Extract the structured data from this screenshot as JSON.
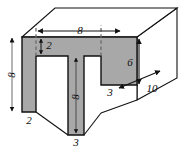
{
  "figure": {
    "name": "u-shaped-prism-diagram",
    "colors": {
      "face_fill": "#a8a8a8",
      "top_fill": "#ffffff",
      "side_fill": "#ffffff",
      "outline": "#111111",
      "hidden_line": "#6b6b6b",
      "background": "#ffffff",
      "text": "#0d0d0d"
    },
    "dimensions": [
      {
        "id": "top-width",
        "label": "8",
        "x": 80,
        "y": 32,
        "orientation": "horizontal",
        "describes": "width of the top of the U across the front face"
      },
      {
        "id": "flange-thickness",
        "label": "2",
        "x": 48,
        "y": 46,
        "orientation": "vertical",
        "describes": "thickness of the top bar of the U"
      },
      {
        "id": "overall-height",
        "label": "8",
        "x": 7,
        "y": 75,
        "orientation": "vertical",
        "describes": "overall height of the front face"
      },
      {
        "id": "stem-height",
        "label": "8",
        "x": 70,
        "y": 99,
        "orientation": "vertical",
        "describes": "height of the central stem"
      },
      {
        "id": "right-depth-height",
        "label": "6",
        "x": 128,
        "y": 63,
        "orientation": "vertical",
        "describes": "height of the right leg of the U"
      },
      {
        "id": "left-leg-width",
        "label": "2",
        "x": 28,
        "y": 120,
        "orientation": "horizontal",
        "describes": "width of the left leg"
      },
      {
        "id": "stem-width",
        "label": "3",
        "x": 76,
        "y": 142,
        "orientation": "horizontal",
        "describes": "width of the central stem"
      },
      {
        "id": "right-leg-width",
        "label": "3",
        "x": 110,
        "y": 93,
        "orientation": "horizontal",
        "describes": "width of the right leg"
      },
      {
        "id": "prism-depth",
        "label": "10",
        "x": 152,
        "y": 89,
        "orientation": "diagonal",
        "describes": "depth of the prism along the receding axis"
      }
    ],
    "geometry": {
      "front_face_path": "M 22,37 L 137,37 L 137,85 L 101,85 L 101,56 L 84,56 L 84,135 L 68,135 L 68,56 L 36,56 L 36,112 L 22,112 Z",
      "top_face_path": "M 22,37 L 55,8 L 177,8 L 137,37 Z",
      "right_face_path": "M 137,37 L 177,8 L 177,78 L 137,100 Z",
      "bottom_slope_path": "M 36,112 L 68,135 L 84,135 L 101,113 L 137,100 L 137,85 L 101,85 L 101,113 L 84,135 L 84,56 L 68,56 L 68,135 L 36,112 Z",
      "hidden_lines": [
        {
          "x1": 36,
          "y1": 56,
          "x2": 36,
          "y2": 24
        },
        {
          "x1": 101,
          "y1": 56,
          "x2": 101,
          "y2": 24
        }
      ]
    }
  }
}
